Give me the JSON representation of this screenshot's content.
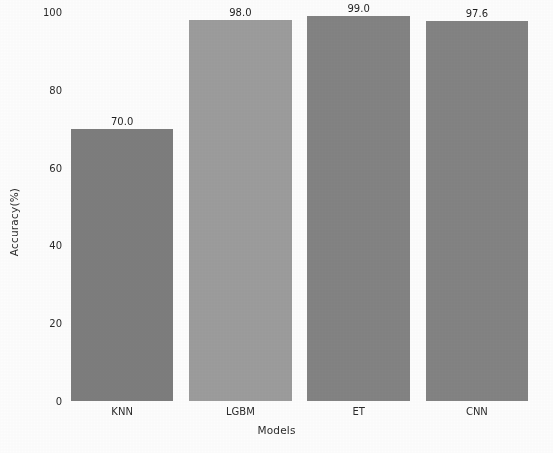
{
  "chart_data": {
    "type": "bar",
    "title": "",
    "subtitle": "",
    "xlabel": "Models",
    "ylabel": "Accuracy(%)",
    "categories": [
      "KNN",
      "LGBM",
      "ET",
      "CNN"
    ],
    "values": [
      70.0,
      98.0,
      99.0,
      97.6
    ],
    "value_labels": [
      "70.0",
      "98.0",
      "99.0",
      "97.6"
    ],
    "bar_colors": [
      "#7d7d7d",
      "#9c9c9c",
      "#838383",
      "#838383"
    ],
    "ylim": [
      0,
      100
    ],
    "yticks": [
      0,
      20,
      40,
      60,
      80,
      100
    ],
    "ytick_labels": [
      "0",
      "20",
      "40",
      "60",
      "80",
      "100"
    ],
    "xtick_labels": [
      "KNN",
      "LGBM",
      "ET",
      "CNN"
    ],
    "grid": false,
    "legend": false,
    "legend_position": "none",
    "background_color": "#ffffff",
    "text_color": "#2b2b2b"
  }
}
